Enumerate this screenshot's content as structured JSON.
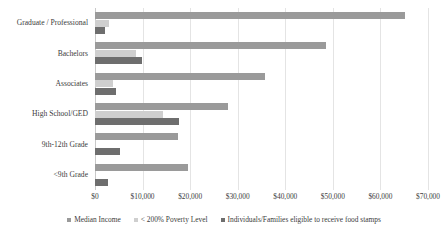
{
  "chart_data": {
    "type": "bar",
    "orientation": "horizontal",
    "title": "",
    "xlabel": "",
    "ylabel": "",
    "xlim": [
      0,
      70000
    ],
    "xticks": [
      "$0",
      "$10,000",
      "$20,000",
      "$30,000",
      "$40,000",
      "$50,000",
      "$60,000",
      "$70,000"
    ],
    "xtick_values": [
      0,
      10000,
      20000,
      30000,
      40000,
      50000,
      60000,
      70000
    ],
    "grid": true,
    "legend_position": "bottom",
    "categories": [
      "Graduate / Professional",
      "Bachelors",
      "Associates",
      "High School/GED",
      "9th-12th Grade",
      "<9th Grade"
    ],
    "series": [
      {
        "name": "Median Income",
        "color": "#9a9a9a",
        "values": [
          65200,
          48500,
          35800,
          27900,
          17400,
          19600
        ]
      },
      {
        "name": "< 200% Poverty Level",
        "color": "#cfcfcf",
        "values": [
          3000,
          8700,
          3800,
          14200,
          0,
          0
        ]
      },
      {
        "name": "Individuals/Families eligible to receive food stamps",
        "color": "#6e6e6e",
        "values": [
          2100,
          9900,
          4400,
          17600,
          5200,
          2700
        ]
      }
    ]
  },
  "legend": {
    "items": [
      {
        "label": "Median Income",
        "color": "#9a9a9a"
      },
      {
        "label": "< 200% Poverty Level",
        "color": "#cfcfcf"
      },
      {
        "label": "Individuals/Families eligible to receive food stamps",
        "color": "#6e6e6e"
      }
    ]
  },
  "colors": {
    "series_median_income": "#9a9a9a",
    "series_poverty_level": "#cfcfcf",
    "series_food_stamps": "#6e6e6e",
    "gridline": "#e4e4e4",
    "axis": "#c9c9c9",
    "text": "#3c3c3c",
    "background": "#ffffff"
  }
}
